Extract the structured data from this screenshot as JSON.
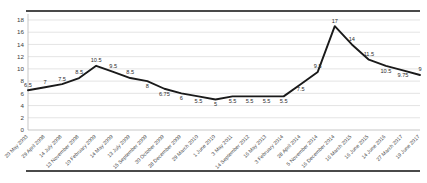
{
  "chart_data": {
    "type": "line",
    "title": "",
    "subtitle": "",
    "xlabel": "",
    "ylabel": "",
    "ylim": [
      0,
      18
    ],
    "ytick_step": 2,
    "yticks": [
      "0",
      "2",
      "4",
      "6",
      "8",
      "10",
      "12",
      "14",
      "16",
      "18"
    ],
    "grid": true,
    "legend": false,
    "legend_position": "none",
    "line_color": "#1a1a1a",
    "grid_color": "#d8d8d8",
    "rule_color": "#4a4a4a",
    "categories": [
      "20 May 2003",
      "29 April 2008",
      "14 July 2008",
      "13 November 2008",
      "10 February 2009",
      "14 May 2009",
      "13 July 2009",
      "15 September 2009",
      "30 October 2009",
      "28 December 2009",
      "29 March 2010",
      "1 June 2010",
      "3 May 2011",
      "14 September 2012",
      "16 May 2013",
      "3 February 2014",
      "28 April 2014",
      "5 November 2014",
      "16 December 2014",
      "16 March 2015",
      "16 June 2015",
      "14 June 2016",
      "27 March 2017",
      "19 June 2017"
    ],
    "values": [
      6.5,
      7,
      7.5,
      8.5,
      10.5,
      9.5,
      8.5,
      8,
      6.75,
      6,
      5.5,
      5,
      5.5,
      5.5,
      5.5,
      5.5,
      7.5,
      9.5,
      17,
      14,
      11.5,
      10.5,
      9.75,
      9
    ],
    "point_labels": [
      "6.5",
      "7",
      "7.5",
      "8.5",
      "10.5",
      "9.5",
      "8.5",
      "8",
      "6.75",
      "6",
      "5.5",
      "5",
      "5.5",
      "5.5",
      "5.5",
      "5.5",
      "7.5",
      "9.5",
      "17",
      "14",
      "11.5",
      "10.5",
      "9.75",
      "9"
    ],
    "label_offsets": [
      -1,
      -1,
      -1,
      -1,
      -1,
      -1,
      -1,
      1,
      1,
      1,
      1,
      1,
      1,
      1,
      1,
      1,
      1,
      -1,
      -1,
      -1,
      -1,
      1,
      1,
      -1
    ]
  }
}
